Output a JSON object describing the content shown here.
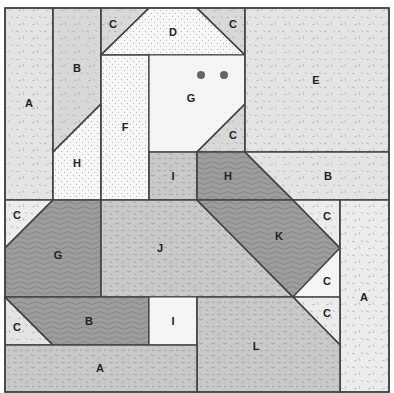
{
  "diagram": {
    "border_color": "#444444",
    "fills": {
      "light_speckle": "#e4e4e4",
      "lighter_speckle": "#ececec",
      "white_dots": "#f7f7f7",
      "white": "#f5f5f5",
      "mid_speckle": "#c9c9c9",
      "dark_wavy": "#9d9d9d",
      "light_solid": "#d8d8d8"
    },
    "pieces": [
      {
        "id": "A-left",
        "label": "A",
        "fill": "light_speckle",
        "points": "5,8 53,8 53,200 5,200",
        "lx": 29,
        "ly": 103
      },
      {
        "id": "B-top",
        "label": "B",
        "fill": "light_solid",
        "points": "53,8 101,8 101,104 53,152",
        "lx": 77,
        "ly": 68
      },
      {
        "id": "H-left",
        "label": "H",
        "fill": "white_dots",
        "points": "53,152 101,104 101,200 53,200",
        "lx": 77,
        "ly": 163
      },
      {
        "id": "C-top-left",
        "label": "C",
        "fill": "light_solid",
        "points": "101,8 149,8 101,55",
        "lx": 113,
        "ly": 24
      },
      {
        "id": "D",
        "label": "D",
        "fill": "white_dots",
        "points": "149,8 197,8 245,55 101,55",
        "lx": 173,
        "ly": 32
      },
      {
        "id": "C-top-right",
        "label": "C",
        "fill": "light_solid",
        "points": "197,8 245,8 245,55",
        "lx": 233,
        "ly": 24
      },
      {
        "id": "F",
        "label": "F",
        "fill": "white_dots",
        "points": "101,55 149,55 149,200 101,200",
        "lx": 125,
        "ly": 127
      },
      {
        "id": "G-head",
        "label": "G",
        "fill": "white",
        "points": "149,55 245,55 245,104 197,152 149,152",
        "lx": 191,
        "ly": 98
      },
      {
        "id": "C-mid",
        "label": "C",
        "fill": "light_solid",
        "points": "245,104 245,152 197,152",
        "lx": 233,
        "ly": 135
      },
      {
        "id": "E",
        "label": "E",
        "fill": "light_speckle",
        "points": "245,8 389,8 389,152 245,152",
        "lx": 316,
        "ly": 80
      },
      {
        "id": "I-top",
        "label": "I",
        "fill": "mid_speckle",
        "points": "149,152 197,152 197,200 149,200",
        "lx": 173,
        "ly": 176
      },
      {
        "id": "H-right",
        "label": "H",
        "fill": "dark_wavy",
        "points": "197,152 245,152 293,200 197,200",
        "lx": 228,
        "ly": 176
      },
      {
        "id": "B-right",
        "label": "B",
        "fill": "light_speckle",
        "points": "245,152 389,152 389,200 293,200",
        "lx": 328,
        "ly": 176
      },
      {
        "id": "C-left",
        "label": "C",
        "fill": "lighter_speckle",
        "points": "5,200 53,200 5,248",
        "lx": 17,
        "ly": 215
      },
      {
        "id": "G-body",
        "label": "G",
        "fill": "dark_wavy",
        "points": "53,200 101,200 101,297 5,297 5,248",
        "lx": 58,
        "ly": 255
      },
      {
        "id": "J",
        "label": "J",
        "fill": "mid_speckle",
        "points": "101,200 197,200 293,297 101,297",
        "lx": 160,
        "ly": 248
      },
      {
        "id": "K",
        "label": "K",
        "fill": "dark_wavy",
        "points": "197,200 293,200 340,248 293,297",
        "lx": 279,
        "ly": 236
      },
      {
        "id": "C-right-1",
        "label": "C",
        "fill": "lighter_speckle",
        "points": "293,200 340,200 340,248",
        "lx": 327,
        "ly": 216
      },
      {
        "id": "C-right-2",
        "label": "C",
        "fill": "white",
        "points": "340,248 340,297 293,297",
        "lx": 327,
        "ly": 281
      },
      {
        "id": "A-right",
        "label": "A",
        "fill": "lighter_speckle",
        "points": "340,200 389,200 389,392 340,392",
        "lx": 364,
        "ly": 297
      },
      {
        "id": "C-bottom-left",
        "label": "C",
        "fill": "light_speckle",
        "points": "5,297 53,345 5,345",
        "lx": 17,
        "ly": 327
      },
      {
        "id": "B-bottom",
        "label": "B",
        "fill": "dark_wavy",
        "points": "5,297 149,297 149,345 53,345",
        "lx": 89,
        "ly": 321
      },
      {
        "id": "I-bottom",
        "label": "I",
        "fill": "white",
        "points": "149,297 197,297 197,345 149,345",
        "lx": 173,
        "ly": 321
      },
      {
        "id": "C-right-3",
        "label": "C",
        "fill": "lighter_speckle",
        "points": "293,297 340,297 340,345",
        "lx": 327,
        "ly": 313
      },
      {
        "id": "L",
        "label": "L",
        "fill": "mid_speckle",
        "points": "197,297 293,297 340,345 340,392 197,392",
        "lx": 256,
        "ly": 346
      },
      {
        "id": "A-bottom",
        "label": "A",
        "fill": "mid_speckle",
        "points": "5,345 197,345 197,392 5,392",
        "lx": 100,
        "ly": 368
      }
    ],
    "eyes": [
      {
        "cx": 201,
        "cy": 75,
        "r": 4
      },
      {
        "cx": 224,
        "cy": 75,
        "r": 4
      }
    ]
  }
}
